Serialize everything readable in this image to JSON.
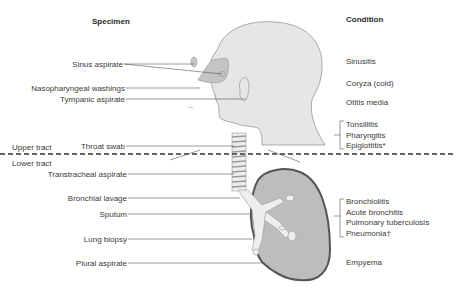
{
  "headers": {
    "specimen": "Specimen",
    "condition": "Condition"
  },
  "regions": {
    "upper": "Upper tract",
    "lower": "Lower tract"
  },
  "specimens": [
    {
      "label": "Sinus aspirate"
    },
    {
      "label": "Nasopharyngeal washings"
    },
    {
      "label": "Tympanic aspirate"
    },
    {
      "label": "Throat swab"
    },
    {
      "label": "Transtracheal aspirate"
    },
    {
      "label": "Bronchial lavage"
    },
    {
      "label": "Sputum"
    },
    {
      "label": "Lung biopsy"
    },
    {
      "label": "Plural aspirate"
    }
  ],
  "conditions": {
    "sinusitis": "Sinusitis",
    "coryza": "Coryza (cold)",
    "otitis": "Otitis media",
    "throat_group": [
      "Tonsillitis",
      "Pharyngitis",
      "Epiglottitis*"
    ],
    "lung_group": [
      "Bronchiolitis",
      "Acute bronchitis",
      "Pulmonary tuberculosis",
      "Pneumonia†"
    ],
    "empyema": "Empyema"
  },
  "colors": {
    "head_fill": "#e6e6e6",
    "lung_fill": "#bdbdbd",
    "lung_stroke": "#555555",
    "nasal_fill": "#c4c4c4",
    "line": "#555555"
  }
}
